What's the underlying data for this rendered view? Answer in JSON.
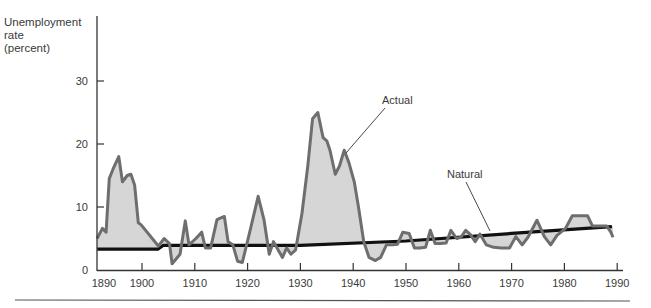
{
  "chart_data": {
    "type": "area",
    "title": "",
    "xlabel": "",
    "ylabel": [
      "Unemployment",
      "rate",
      "(percent)"
    ],
    "ylim": [
      0,
      30
    ],
    "xlim": [
      1890,
      1990
    ],
    "grid": false,
    "x_ticks": [
      1890,
      1900,
      1910,
      1920,
      1930,
      1940,
      1950,
      1960,
      1970,
      1980,
      1990
    ],
    "y_ticks": [
      0,
      10,
      20,
      30
    ],
    "annotations": [
      {
        "text": "Actual",
        "series": "Actual"
      },
      {
        "text": "Natural",
        "series": "Natural"
      }
    ],
    "series": [
      {
        "name": "Actual",
        "color": "#6e6e6e",
        "fill": "#d6d6d6",
        "x": [
          1891.5,
          1892.5,
          1893.2,
          1893.8,
          1894.5,
          1895.6,
          1896.3,
          1897.2,
          1897.9,
          1898.6,
          1899.3,
          1899.8,
          1903.1,
          1904.2,
          1905.2,
          1905.7,
          1907.2,
          1908.2,
          1908.9,
          1910.2,
          1911.3,
          1912.0,
          1913.0,
          1914.2,
          1915.6,
          1916.3,
          1917.2,
          1918.1,
          1919.0,
          1920.4,
          1922.0,
          1923.1,
          1924.1,
          1924.9,
          1925.9,
          1926.6,
          1927.4,
          1928.2,
          1929.1,
          1930.3,
          1931.4,
          1932.3,
          1933.3,
          1934.3,
          1935.0,
          1935.6,
          1936.6,
          1937.4,
          1938.3,
          1939.2,
          1940.2,
          1941.0,
          1942.0,
          1943.0,
          1944.2,
          1945.2,
          1946.3,
          1947.5,
          1948.4,
          1949.4,
          1950.6,
          1951.6,
          1952.6,
          1953.7,
          1954.6,
          1955.5,
          1956.5,
          1957.6,
          1958.5,
          1959.6,
          1960.4,
          1961.3,
          1962.2,
          1963.1,
          1964.0,
          1965.2,
          1966.6,
          1968.0,
          1969.6,
          1970.8,
          1972.0,
          1973.1,
          1974.8,
          1976.2,
          1977.4,
          1978.6,
          1980.2,
          1981.5,
          1982.6,
          1984.4,
          1985.3,
          1986.5,
          1988.0,
          1988.8,
          1989.2
        ],
        "values": [
          5.0,
          6.6,
          6.0,
          14.5,
          16.0,
          18.0,
          14.0,
          15.0,
          15.2,
          13.5,
          7.5,
          7.2,
          3.8,
          5.0,
          4.2,
          1.0,
          2.5,
          7.8,
          4.0,
          5.0,
          6.0,
          3.5,
          3.5,
          8.0,
          8.5,
          4.5,
          4.0,
          1.4,
          1.2,
          6.0,
          11.7,
          8.0,
          2.5,
          4.5,
          3.0,
          2.0,
          3.5,
          2.5,
          3.2,
          9.0,
          16.5,
          24.0,
          25.0,
          21.0,
          20.5,
          19.0,
          15.2,
          16.5,
          19.0,
          17.0,
          14.0,
          10.0,
          4.5,
          2.0,
          1.5,
          2.0,
          4.0,
          4.0,
          4.1,
          6.0,
          5.8,
          3.5,
          3.5,
          3.6,
          6.3,
          4.2,
          4.2,
          4.3,
          6.3,
          5.0,
          5.2,
          6.3,
          5.6,
          4.5,
          5.7,
          4.0,
          3.6,
          3.5,
          3.5,
          5.3,
          4.0,
          5.2,
          7.9,
          5.3,
          4.0,
          5.5,
          6.6,
          8.6,
          8.6,
          8.6,
          7.0,
          7.0,
          7.0,
          6.0,
          5.2
        ]
      },
      {
        "name": "Natural",
        "color": "#111111",
        "x": [
          1891.5,
          1903.0,
          1904.0,
          1930.0,
          1950.0,
          1970.0,
          1989.0
        ],
        "values": [
          3.3,
          3.3,
          3.9,
          3.9,
          4.6,
          5.8,
          6.9
        ]
      }
    ]
  },
  "axis": {
    "y_ticks": [
      {
        "label": "0",
        "value": 0
      },
      {
        "label": "10",
        "value": 10
      },
      {
        "label": "20",
        "value": 20
      },
      {
        "label": "30",
        "value": 30
      }
    ],
    "x_ticks": [
      {
        "label": "1890",
        "value": 1890
      },
      {
        "label": "1900",
        "value": 1900
      },
      {
        "label": "1910",
        "value": 1910
      },
      {
        "label": "1920",
        "value": 1920
      },
      {
        "label": "1930",
        "value": 1930
      },
      {
        "label": "1940",
        "value": 1940
      },
      {
        "label": "1950",
        "value": 1950
      },
      {
        "label": "1960",
        "value": 1960
      },
      {
        "label": "1970",
        "value": 1970
      },
      {
        "label": "1980",
        "value": 1980
      },
      {
        "label": "1990",
        "value": 1990
      }
    ]
  },
  "labels": {
    "ylabel_line1": "Unemployment",
    "ylabel_line2": "rate",
    "ylabel_line3": "(percent)",
    "actual": "Actual",
    "natural": "Natural"
  }
}
